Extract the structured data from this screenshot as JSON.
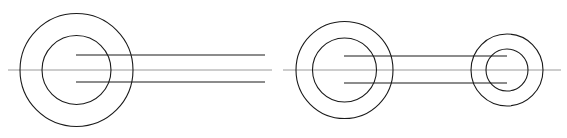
{
  "figure": {
    "type": "technical-line-drawing",
    "width": 567,
    "height": 138,
    "background_color": "#ffffff",
    "stroke_color": "#1a1a1a",
    "centerline_color": "#9a9a9a",
    "stroke_width": 1.1
  },
  "geometry": {
    "axis_y": 70,
    "views": [
      {
        "name": "left-view",
        "label": "Left end view with trailing profile lines",
        "circles": [
          {
            "name": "left-outer-circle",
            "cx": 76.5,
            "cy": 70,
            "r": 56.5
          },
          {
            "name": "left-inner-circle",
            "cx": 76.5,
            "cy": 70,
            "r": 34.5
          }
        ],
        "profile_lines": [
          {
            "name": "upper-profile-line",
            "x1": 76,
            "y1": 55,
            "x2": 265,
            "y2": 55
          },
          {
            "name": "lower-profile-line",
            "x1": 76,
            "y1": 82,
            "x2": 265,
            "y2": 82
          }
        ],
        "centerline": {
          "name": "left-centerline",
          "x1": 8,
          "y1": 70,
          "x2": 272,
          "y2": 70
        }
      },
      {
        "name": "right-view",
        "label": "Right assembly: large annulus joined to small annulus",
        "circles": [
          {
            "name": "right-large-outer-circle",
            "cx": 344.5,
            "cy": 70,
            "r": 48.5
          },
          {
            "name": "right-large-inner-circle",
            "cx": 344.5,
            "cy": 70,
            "r": 32
          },
          {
            "name": "right-small-outer-circle",
            "cx": 507,
            "cy": 70,
            "r": 36
          },
          {
            "name": "right-small-inner-circle",
            "cx": 507,
            "cy": 70,
            "r": 21
          }
        ],
        "profile_lines": [
          {
            "name": "upper-connector-line",
            "x1": 344,
            "y1": 56,
            "x2": 507,
            "y2": 56
          },
          {
            "name": "lower-connector-line",
            "x1": 344,
            "y1": 83,
            "x2": 507,
            "y2": 83
          }
        ],
        "centerline": {
          "name": "right-centerline",
          "x1": 283,
          "y1": 70,
          "x2": 561,
          "y2": 70
        }
      }
    ]
  }
}
